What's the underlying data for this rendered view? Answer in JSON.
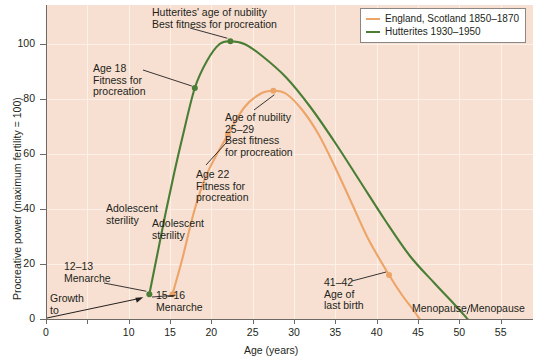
{
  "chart_data": {
    "type": "line",
    "title": "",
    "xlabel": "Age (years)",
    "ylabel": "Procreative power (maximum fertility = 100)",
    "xlim": [
      0,
      58
    ],
    "ylim": [
      0,
      110
    ],
    "xticks": [
      0,
      5,
      10,
      15,
      20,
      25,
      30,
      35,
      40,
      45,
      50,
      55
    ],
    "yticks": [
      0,
      20,
      40,
      60,
      80,
      100
    ],
    "xticklabels": [
      "0",
      "",
      "10",
      "15",
      "20",
      "25",
      "30",
      "35",
      "40",
      "45",
      "50",
      "55"
    ],
    "yticklabels": [
      "0",
      "20",
      "40",
      "60",
      "80",
      "100"
    ],
    "grid": true,
    "legend_position": "top-right",
    "series": [
      {
        "name": "England, Scotland 1850–1870",
        "color": "#eda468",
        "points": [
          {
            "x": 15.3,
            "y": 9
          },
          {
            "x": 16.5,
            "y": 22
          },
          {
            "x": 18.0,
            "y": 40
          },
          {
            "x": 19.5,
            "y": 53
          },
          {
            "x": 22.0,
            "y": 67
          },
          {
            "x": 24.0,
            "y": 77
          },
          {
            "x": 26.0,
            "y": 82
          },
          {
            "x": 27.5,
            "y": 83
          },
          {
            "x": 29.0,
            "y": 82
          },
          {
            "x": 31.0,
            "y": 76
          },
          {
            "x": 33.0,
            "y": 67
          },
          {
            "x": 35.0,
            "y": 55
          },
          {
            "x": 37.0,
            "y": 42
          },
          {
            "x": 39.0,
            "y": 29
          },
          {
            "x": 41.5,
            "y": 16
          },
          {
            "x": 43.0,
            "y": 9
          },
          {
            "x": 44.5,
            "y": 3
          },
          {
            "x": 45.2,
            "y": 0
          }
        ],
        "markers": [
          {
            "x": 15.3,
            "y": 9,
            "label": "15–16 Menarche"
          },
          {
            "x": 22.0,
            "y": 67,
            "label": "Age 22 Fitness for procreation"
          },
          {
            "x": 27.5,
            "y": 83,
            "label": "Age of nubility 25–29 Best fitness for procreation"
          },
          {
            "x": 41.5,
            "y": 16,
            "label": "41–42 Age of last birth"
          }
        ]
      },
      {
        "name": "Hutterites 1930–1950",
        "color": "#4a7d35",
        "points": [
          {
            "x": 12.5,
            "y": 9
          },
          {
            "x": 13.5,
            "y": 24
          },
          {
            "x": 14.5,
            "y": 39
          },
          {
            "x": 15.5,
            "y": 53
          },
          {
            "x": 16.5,
            "y": 66
          },
          {
            "x": 18.0,
            "y": 84
          },
          {
            "x": 19.5,
            "y": 94
          },
          {
            "x": 21.0,
            "y": 100
          },
          {
            "x": 22.3,
            "y": 101
          },
          {
            "x": 24.0,
            "y": 100
          },
          {
            "x": 26.0,
            "y": 96
          },
          {
            "x": 29.0,
            "y": 88
          },
          {
            "x": 32.0,
            "y": 77
          },
          {
            "x": 35.0,
            "y": 64
          },
          {
            "x": 38.0,
            "y": 50
          },
          {
            "x": 41.0,
            "y": 36
          },
          {
            "x": 44.0,
            "y": 23
          },
          {
            "x": 47.0,
            "y": 13
          },
          {
            "x": 49.5,
            "y": 5
          },
          {
            "x": 51.0,
            "y": 0
          }
        ],
        "markers": [
          {
            "x": 12.5,
            "y": 9,
            "label": "12–13 Menarche"
          },
          {
            "x": 18.0,
            "y": 84,
            "label": "Age 18 Fitness for procreation"
          },
          {
            "x": 22.3,
            "y": 101,
            "label": "Hutterites' age of nubility Best fitness for procreation"
          }
        ]
      }
    ],
    "annotations": [
      {
        "id": "hutterites-nubility",
        "text": "Hutterites' age of nubility\nBest fitness for procreation"
      },
      {
        "id": "age-18",
        "text": "Age 18\nFitness for\nprocreation"
      },
      {
        "id": "age-nubility-25-29",
        "text": "Age of nubility\n25–29\nBest fitness\nfor procreation"
      },
      {
        "id": "age-22",
        "text": "Age 22\nFitness for\nprocreation"
      },
      {
        "id": "adolescent-sterility-green",
        "text": "Adolescent\nsterility"
      },
      {
        "id": "adolescent-sterility-orange",
        "text": "Adolescent\nsterility"
      },
      {
        "id": "menarche-12-13",
        "text": "12–13\nMenarche"
      },
      {
        "id": "menarche-15-16",
        "text": "15–16\nMenarche"
      },
      {
        "id": "growth-to",
        "text": "Growth\nto"
      },
      {
        "id": "age-last-birth",
        "text": "41–42\nAge of\nlast birth"
      },
      {
        "id": "menopause-orange",
        "text": "Menopause"
      },
      {
        "id": "menopause-green",
        "text": "Menopause"
      }
    ]
  },
  "axis": {
    "y_title": "Procreative power (maximum fertility = 100)",
    "x_title": "Age (years)",
    "y_ticks": [
      "100",
      "80",
      "60",
      "40",
      "20",
      "0"
    ],
    "x_ticks": [
      "0",
      "10",
      "15",
      "20",
      "25",
      "30",
      "35",
      "40",
      "45",
      "50",
      "55"
    ]
  },
  "legend": {
    "items": [
      {
        "label": "England, Scotland 1850–1870",
        "color": "#eda468"
      },
      {
        "label": "Hutterites 1930–1950",
        "color": "#4a7d35"
      }
    ]
  },
  "annotations": {
    "hutterites_nubility_l1": "Hutterites' age of nubility",
    "hutterites_nubility_l2": "Best fitness for procreation",
    "age18_l1": "Age 18",
    "age18_l2": "Fitness for",
    "age18_l3": "procreation",
    "nubility_l1": "Age of nubility",
    "nubility_l2": "25–29",
    "nubility_l3": "Best fitness",
    "nubility_l4": "for procreation",
    "age22_l1": "Age 22",
    "age22_l2": "Fitness for",
    "age22_l3": "procreation",
    "adolescent_green_l1": "Adolescent",
    "adolescent_green_l2": "sterility",
    "adolescent_orange_l1": "Adolescent",
    "adolescent_orange_l2": "sterility",
    "menarche12_l1": "12–13",
    "menarche12_l2": "Menarche",
    "menarche15_l1": "15–16",
    "menarche15_l2": "Menarche",
    "growth_l1": "Growth",
    "growth_l2": "to",
    "lastbirth_l1": "41–42",
    "lastbirth_l2": "Age of",
    "lastbirth_l3": "last birth",
    "menopause_orange": "Menopause",
    "menopause_green": "Menopause"
  },
  "colors": {
    "panel_bg": "#f7e0d1",
    "gridline": "#fdf0e6",
    "orange": "#eda468",
    "green": "#4a7d35",
    "axis": "#6d6a66",
    "text": "#231f20"
  }
}
